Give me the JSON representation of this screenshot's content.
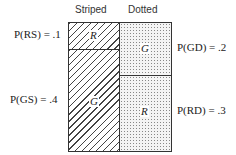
{
  "headers": {
    "striped": "Striped",
    "dotted": "Dotted"
  },
  "cells": {
    "striped_top": "R",
    "striped_bottom": "G",
    "dotted_top": "G",
    "dotted_bottom": "R"
  },
  "probabilities": {
    "RS": "P(RS) = .1",
    "GS": "P(GS) = .4",
    "GD": "P(GD) = .2",
    "RD": "P(RD) = .3"
  }
}
